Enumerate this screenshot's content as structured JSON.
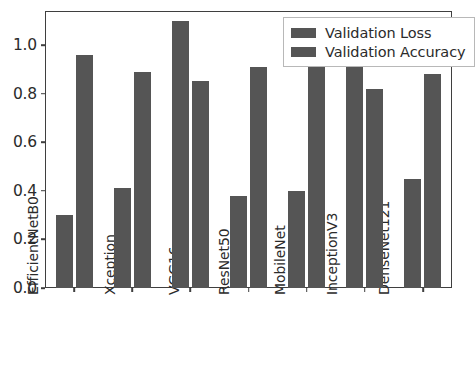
{
  "chart_data": {
    "type": "bar",
    "title": "",
    "xlabel": "",
    "ylabel": "",
    "categories": [
      "EfficientNetB0",
      "Xception",
      "VGG16",
      "ResNet50",
      "MobileNet",
      "InceptionV3",
      "DenseNet121"
    ],
    "series": [
      {
        "name": "Validation Loss",
        "color": "#555555",
        "values": [
          0.3,
          0.41,
          1.1,
          0.38,
          0.4,
          0.96,
          0.45
        ]
      },
      {
        "name": "Validation Accuracy",
        "color": "#555555",
        "values": [
          0.96,
          0.89,
          0.85,
          0.91,
          0.92,
          0.82,
          0.88
        ]
      }
    ],
    "ylim": [
      0.0,
      1.14
    ],
    "yticks": [
      "0.0",
      "0.2",
      "0.4",
      "0.6",
      "0.8",
      "1.0"
    ],
    "ytick_values": [
      0.0,
      0.2,
      0.4,
      0.6,
      0.8,
      1.0
    ],
    "grid": false,
    "legend_position": "upper right",
    "legend_entries": [
      "Validation Loss",
      "Validation Accuracy"
    ],
    "axis_color": "#3f3f3f",
    "background_color": "#ffffff"
  }
}
